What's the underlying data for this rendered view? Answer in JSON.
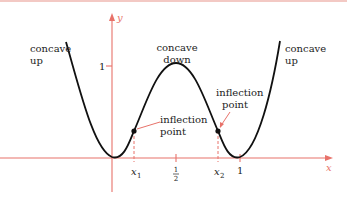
{
  "figure": {
    "axes": {
      "x_label": "x",
      "y_label": "y",
      "y_tick_label": "1",
      "x_ticks": [
        {
          "label": "x",
          "sub": "1"
        },
        {
          "label": "1/2"
        },
        {
          "label": "x",
          "sub": "2"
        },
        {
          "label": "1"
        }
      ]
    },
    "annotations": {
      "left_concave": [
        "concave",
        "up"
      ],
      "middle_concave": [
        "concave",
        "down"
      ],
      "right_concave": [
        "concave",
        "up"
      ],
      "inflection_left": [
        "inflection",
        "point"
      ],
      "inflection_right": [
        "inflection",
        "point"
      ]
    },
    "colors": {
      "axis": "#e8726a",
      "curve": "#111111",
      "text": "#222222"
    }
  }
}
